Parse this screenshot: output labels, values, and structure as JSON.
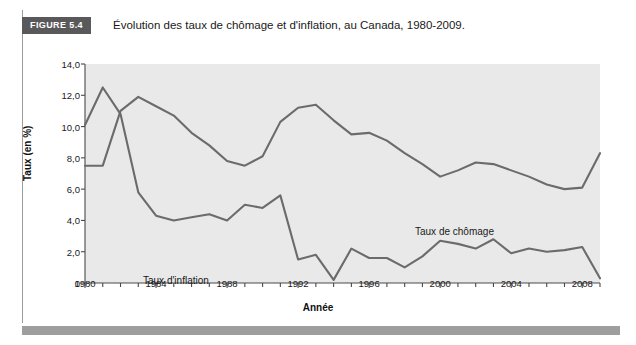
{
  "figure": {
    "badge": "FIGURE 5.4",
    "title": "Évolution des taux de chômage et d'inflation, au Canada, 1980-2009."
  },
  "colors": {
    "badge_background": "#59595b",
    "badge_text": "#ffffff",
    "plot_background": "#e9e9e9",
    "line_unemployment": "#6b6b6b",
    "line_inflation": "#6b6b6b",
    "axis": "#4a4a4a",
    "bottom_bar": "#9e9e9e"
  },
  "chart_data": {
    "type": "line",
    "title": "Évolution des taux de chômage et d'inflation, au Canada, 1980-2009.",
    "xlabel": "Année",
    "ylabel": "Taux (en %)",
    "xlim": [
      1980,
      2009
    ],
    "ylim": [
      0,
      14
    ],
    "grid": false,
    "legend_position": "inline-annotations",
    "x_tick_labels": [
      "1980",
      "1984",
      "1988",
      "1992",
      "1996",
      "2000",
      "2004",
      "2008"
    ],
    "x_tick_values": [
      1980,
      1984,
      1988,
      1992,
      1996,
      2000,
      2004,
      2008
    ],
    "x_minor_tick_interval": 1,
    "y_tick_labels": [
      "0",
      "2,0",
      "4,0",
      "6,0",
      "8,0",
      "10,0",
      "12,0",
      "14,0"
    ],
    "y_tick_values": [
      0,
      2,
      4,
      6,
      8,
      10,
      12,
      14
    ],
    "x": [
      1980,
      1981,
      1982,
      1983,
      1984,
      1985,
      1986,
      1987,
      1988,
      1989,
      1990,
      1991,
      1992,
      1993,
      1994,
      1995,
      1996,
      1997,
      1998,
      1999,
      2000,
      2001,
      2002,
      2003,
      2004,
      2005,
      2006,
      2007,
      2008,
      2009
    ],
    "series": [
      {
        "name": "Taux de chômage",
        "label": "Taux de chômage",
        "values": [
          7.5,
          7.5,
          11.0,
          11.9,
          11.3,
          10.7,
          9.6,
          8.8,
          7.8,
          7.5,
          8.1,
          10.3,
          11.2,
          11.4,
          10.4,
          9.5,
          9.6,
          9.1,
          8.3,
          7.6,
          6.8,
          7.2,
          7.7,
          7.6,
          7.2,
          6.8,
          6.3,
          6.0,
          6.1,
          8.3
        ]
      },
      {
        "name": "Taux d'inflation",
        "label": "Taux d'inflation",
        "values": [
          10.1,
          12.5,
          10.8,
          5.8,
          4.3,
          4.0,
          4.2,
          4.4,
          4.0,
          5.0,
          4.8,
          5.6,
          1.5,
          1.8,
          0.2,
          2.2,
          1.6,
          1.6,
          1.0,
          1.7,
          2.7,
          2.5,
          2.2,
          2.8,
          1.9,
          2.2,
          2.0,
          2.1,
          2.3,
          0.3
        ]
      }
    ]
  },
  "annotations": [
    {
      "text": "Taux de chômage",
      "x": 415,
      "y": 180
    },
    {
      "text": "Taux d'inflation",
      "x": 143,
      "y": 229
    }
  ]
}
